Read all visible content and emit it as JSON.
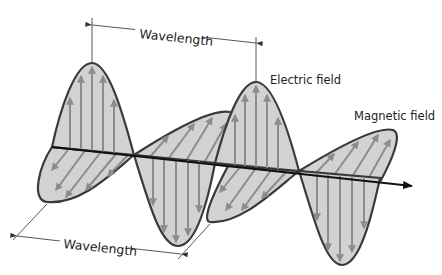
{
  "diagram": {
    "labels": {
      "wavelength_top": "Wavelength",
      "wavelength_bottom": "Wavelength",
      "electric_field": "Electric field",
      "magnetic_field": "Magnetic field"
    },
    "colors": {
      "fill": "#d2d2d2",
      "field_arrows": "#8c8c8c",
      "outline": "#3a3a3a",
      "axis": "#111111",
      "dimension_lines": "#444444"
    },
    "elements": [
      {
        "type": "axis",
        "name": "propagation-axis",
        "from": [
          52,
          147
        ],
        "to": [
          412,
          186
        ]
      },
      {
        "type": "electric-lobe",
        "direction": "up",
        "peak": [
          92,
          63
        ]
      },
      {
        "type": "electric-lobe",
        "direction": "down",
        "peak": [
          178,
          246
        ]
      },
      {
        "type": "electric-lobe",
        "direction": "up",
        "peak": [
          256,
          82
        ]
      },
      {
        "type": "electric-lobe",
        "direction": "down",
        "peak": [
          342,
          265
        ]
      },
      {
        "type": "magnetic-lobe",
        "direction": "back",
        "peak": [
          47,
          202
        ]
      },
      {
        "type": "magnetic-lobe",
        "direction": "front",
        "peak": [
          230,
          112
        ]
      },
      {
        "type": "magnetic-lobe",
        "direction": "back",
        "peak": [
          210,
          222
        ]
      },
      {
        "type": "magnetic-lobe",
        "direction": "front",
        "peak": [
          393,
          130
        ]
      }
    ]
  }
}
